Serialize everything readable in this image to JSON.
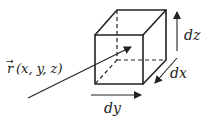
{
  "diagram": {
    "type": "volume-element",
    "labels": {
      "position_vector": "r(x,y,z)",
      "position_vector_arrow": "→",
      "r_symbol": "r",
      "args": "(x, y, z)",
      "dx": "dx",
      "dy": "dy",
      "dz": "dz"
    },
    "colors": {
      "stroke": "#222222",
      "background": "#ffffff"
    },
    "cube": {
      "front": [
        [
          95,
          35
        ],
        [
          143,
          35
        ],
        [
          143,
          84
        ],
        [
          95,
          84
        ]
      ],
      "back": [
        [
          117,
          10
        ],
        [
          166,
          10
        ],
        [
          166,
          60
        ],
        [
          117,
          60
        ]
      ],
      "hidden_edges": "dashed"
    },
    "arrows": {
      "position_vector": {
        "from": [
          28,
          98
        ],
        "to": [
          131,
          47
        ]
      },
      "dz": {
        "from": [
          177,
          51
        ],
        "to": [
          177,
          12
        ]
      },
      "dx": {
        "from": [
          177,
          58
        ],
        "to": [
          155,
          83
        ]
      },
      "dy": {
        "from": [
          91,
          95
        ],
        "to": [
          141,
          95
        ]
      }
    }
  }
}
